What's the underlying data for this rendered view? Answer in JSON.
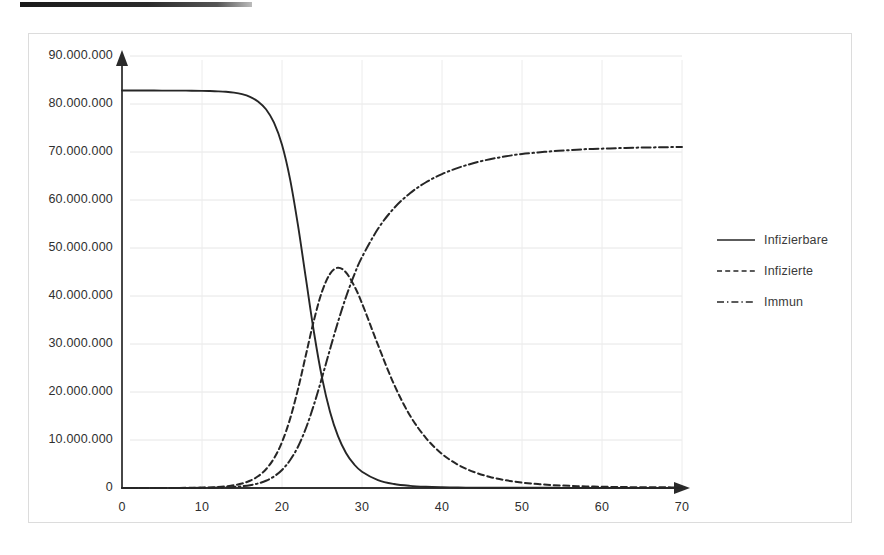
{
  "artifact": {
    "name": "scan-edge-bar"
  },
  "chart_data": {
    "type": "line",
    "title": "",
    "subtitle": "",
    "xlabel": "",
    "ylabel": "",
    "xlim": [
      0,
      70
    ],
    "ylim": [
      0,
      90000000
    ],
    "grid": true,
    "legend_position": "right",
    "x_ticks": [
      "0",
      "10",
      "20",
      "30",
      "40",
      "50",
      "60",
      "70"
    ],
    "x_tick_values": [
      0,
      10,
      20,
      30,
      40,
      50,
      60,
      70
    ],
    "y_ticks": [
      "0",
      "10.000.000",
      "20.000.000",
      "30.000.000",
      "40.000.000",
      "50.000.000",
      "60.000.000",
      "70.000.000",
      "80.000.000",
      "90.000.000"
    ],
    "y_tick_values": [
      0,
      10000000,
      20000000,
      30000000,
      40000000,
      50000000,
      60000000,
      70000000,
      80000000,
      90000000
    ],
    "population_total": 82800000,
    "x": [
      0,
      2,
      4,
      6,
      8,
      10,
      11,
      12,
      13,
      14,
      15,
      16,
      17,
      18,
      19,
      20,
      21,
      22,
      23,
      24,
      25,
      26,
      27,
      28,
      29,
      30,
      32,
      34,
      36,
      38,
      40,
      42,
      44,
      46,
      48,
      50,
      52,
      54,
      56,
      58,
      60,
      62,
      64,
      66,
      68,
      70
    ],
    "series": [
      {
        "name": "Infizierbare",
        "style": "solid",
        "color": "#262626",
        "values": [
          82800000,
          82800000,
          82800000,
          82790000,
          82780000,
          82740000,
          82700000,
          82640000,
          82540000,
          82360000,
          82050000,
          81500000,
          80540000,
          78900000,
          76100000,
          71500000,
          64400000,
          54700000,
          43500000,
          32400000,
          23000000,
          15900000,
          10800000,
          7300000,
          4950000,
          3400000,
          1650000,
          830000,
          440000,
          250000,
          155000,
          105000,
          76000,
          60000,
          50000,
          44000,
          40000,
          37500,
          36000,
          35000,
          34400,
          34000,
          33700,
          33500,
          33400,
          33300
        ]
      },
      {
        "name": "Infizierte",
        "style": "dashed",
        "color": "#262626",
        "values": [
          1000,
          2000,
          4000,
          11000,
          30000,
          80000,
          130000,
          215000,
          350000,
          570000,
          930000,
          1510000,
          2440000,
          3900000,
          6170000,
          9560000,
          14350000,
          20600000,
          27800000,
          35000000,
          40900000,
          44600000,
          45900000,
          44900000,
          42200000,
          38500000,
          29800000,
          21600000,
          15100000,
          10400000,
          7100000,
          4850000,
          3330000,
          2300000,
          1600000,
          1130000,
          810000,
          590000,
          440000,
          335000,
          262000,
          210000,
          175000,
          150000,
          133000,
          121000
        ]
      },
      {
        "name": "Immun",
        "style": "dashdot",
        "color": "#262626",
        "values": [
          0,
          500,
          1500,
          4000,
          11000,
          30000,
          49000,
          81000,
          133000,
          218000,
          356000,
          580000,
          940000,
          1510000,
          2400000,
          3760000,
          5770000,
          8600000,
          12500000,
          17400000,
          23000000,
          28900000,
          34600000,
          39800000,
          44300000,
          48100000,
          54000000,
          58300000,
          61400000,
          63700000,
          65400000,
          66700000,
          67700000,
          68500000,
          69100000,
          69600000,
          69900000,
          70200000,
          70400000,
          70600000,
          70700000,
          70800000,
          70900000,
          70950000,
          71000000,
          71050000
        ]
      }
    ]
  },
  "legend": {
    "items": [
      {
        "label": "Infizierbare",
        "key": "solid-line-key"
      },
      {
        "label": "Infizierte",
        "key": "dashed-line-key"
      },
      {
        "label": "Immun",
        "key": "dashdot-line-key"
      }
    ]
  }
}
